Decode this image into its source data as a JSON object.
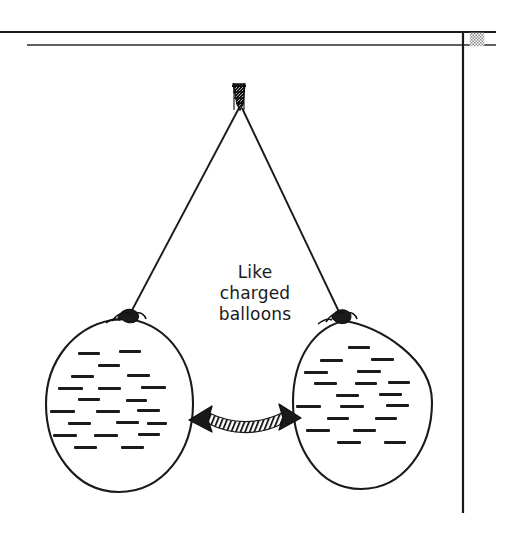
{
  "figure": {
    "background_color": "#ffffff",
    "ink_color": "#1a1a1a",
    "caption": {
      "text": "Like\ncharged\nballoons",
      "lines": [
        "Like",
        "charged",
        "balloons"
      ],
      "center_x": 255,
      "top_y": 262,
      "font_size_px": 17,
      "color": "#1a1a1a"
    },
    "rules": [
      {
        "name": "top-horizontal-rule",
        "x1": 0,
        "y1": 32,
        "x2": 496,
        "y2": 32,
        "width": 2.2
      },
      {
        "name": "second-horizontal-rule",
        "x1": 27,
        "y1": 45,
        "x2": 496,
        "y2": 45,
        "width": 1.8
      },
      {
        "name": "right-vertical-rule",
        "x1": 463,
        "y1": 32,
        "x2": 463,
        "y2": 513,
        "width": 2.2
      }
    ],
    "corner_swatch": {
      "name": "hatched-corner-swatch",
      "x": 470,
      "y": 33,
      "width": 14,
      "height": 13,
      "pattern": "checkerboard",
      "color": "#8c8c8c"
    },
    "clip": {
      "name": "top-clamp",
      "x": 232,
      "y": 82,
      "width": 13,
      "height": 27,
      "fill": "#111111",
      "pattern": "dense-hatch"
    },
    "strings": [
      {
        "name": "left-string",
        "x1": 240,
        "y1": 109,
        "x2": 130,
        "y2": 313
      },
      {
        "name": "right-string",
        "x1": 241,
        "y1": 109,
        "x2": 340,
        "y2": 313
      }
    ],
    "balloons": [
      {
        "name": "left-balloon",
        "center_x": 119,
        "center_y": 406,
        "radius_x": 74,
        "radius_y": 87,
        "charge_symbol": "minus",
        "charge_count": 24,
        "fill": "#ffffff",
        "stroke": "#1a1a1a",
        "knot": {
          "x": 129,
          "y": 314
        }
      },
      {
        "name": "right-balloon",
        "center_x": 362,
        "center_y": 403,
        "radius_x": 70,
        "radius_y": 85,
        "charge_symbol": "minus",
        "charge_count": 24,
        "fill": "#ffffff",
        "stroke": "#1a1a1a",
        "knot": {
          "x": 341,
          "y": 314
        }
      }
    ],
    "repulsion_arrow": {
      "name": "repulsion-double-arrow",
      "left_tip_x": 189,
      "right_tip_x": 301,
      "center_y": 420,
      "shaft_pattern": "diagonal-hatch",
      "heads": "both",
      "meaning": "repulsion"
    },
    "charge_marks_left": [
      {
        "x": 78,
        "y": 353,
        "w": 22
      },
      {
        "x": 119,
        "y": 351,
        "w": 22
      },
      {
        "x": 98,
        "y": 365,
        "w": 22
      },
      {
        "x": 71,
        "y": 376,
        "w": 23
      },
      {
        "x": 127,
        "y": 375,
        "w": 23
      },
      {
        "x": 58,
        "y": 388,
        "w": 25
      },
      {
        "x": 98,
        "y": 388,
        "w": 23
      },
      {
        "x": 141,
        "y": 387,
        "w": 25
      },
      {
        "x": 78,
        "y": 399,
        "w": 22
      },
      {
        "x": 126,
        "y": 400,
        "w": 21
      },
      {
        "x": 50,
        "y": 411,
        "w": 25
      },
      {
        "x": 96,
        "y": 411,
        "w": 24
      },
      {
        "x": 137,
        "y": 410,
        "w": 23
      },
      {
        "x": 68,
        "y": 423,
        "w": 23
      },
      {
        "x": 116,
        "y": 422,
        "w": 23
      },
      {
        "x": 147,
        "y": 423,
        "w": 20
      },
      {
        "x": 53,
        "y": 435,
        "w": 24
      },
      {
        "x": 94,
        "y": 435,
        "w": 24
      },
      {
        "x": 138,
        "y": 434,
        "w": 22
      },
      {
        "x": 74,
        "y": 447,
        "w": 23
      },
      {
        "x": 121,
        "y": 447,
        "w": 23
      }
    ],
    "charge_marks_right": [
      {
        "x": 348,
        "y": 347,
        "w": 22
      },
      {
        "x": 320,
        "y": 360,
        "w": 23
      },
      {
        "x": 371,
        "y": 359,
        "w": 23
      },
      {
        "x": 304,
        "y": 372,
        "w": 24
      },
      {
        "x": 357,
        "y": 371,
        "w": 24
      },
      {
        "x": 314,
        "y": 383,
        "w": 23
      },
      {
        "x": 355,
        "y": 383,
        "w": 22
      },
      {
        "x": 388,
        "y": 382,
        "w": 22
      },
      {
        "x": 336,
        "y": 395,
        "w": 23
      },
      {
        "x": 379,
        "y": 394,
        "w": 23
      },
      {
        "x": 296,
        "y": 406,
        "w": 25
      },
      {
        "x": 340,
        "y": 406,
        "w": 24
      },
      {
        "x": 386,
        "y": 405,
        "w": 23
      },
      {
        "x": 327,
        "y": 418,
        "w": 22
      },
      {
        "x": 375,
        "y": 418,
        "w": 22
      },
      {
        "x": 306,
        "y": 430,
        "w": 24
      },
      {
        "x": 353,
        "y": 430,
        "w": 23
      },
      {
        "x": 337,
        "y": 442,
        "w": 24
      },
      {
        "x": 384,
        "y": 442,
        "w": 22
      }
    ]
  }
}
